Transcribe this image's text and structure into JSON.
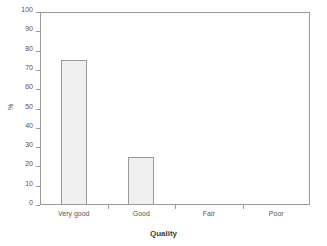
{
  "chart_data": {
    "type": "bar",
    "title": "",
    "subtitle": "",
    "categories": [
      "Very good",
      "Good",
      "Fair",
      "Poor"
    ],
    "values": [
      75,
      25,
      0,
      0
    ],
    "xlabel": "Quality",
    "ylabel": "%",
    "ylim": [
      0,
      100
    ],
    "ytick_labels": [
      "0",
      "10",
      "20",
      "30",
      "40",
      "50",
      "60",
      "70",
      "80",
      "90",
      "100"
    ],
    "ytick_values": [
      0,
      10,
      20,
      30,
      40,
      50,
      60,
      70,
      80,
      90,
      100
    ],
    "grid": false,
    "legend": false,
    "legend_position": "none",
    "bar_fill_color": "#f0f0f0",
    "bar_border_color": "#9a9a9a",
    "axis_color": "#9a9a9a",
    "text_color": "#555555",
    "background_color": "#ffffff"
  },
  "axes": {
    "y_title": "%",
    "x_title": "Quality"
  }
}
